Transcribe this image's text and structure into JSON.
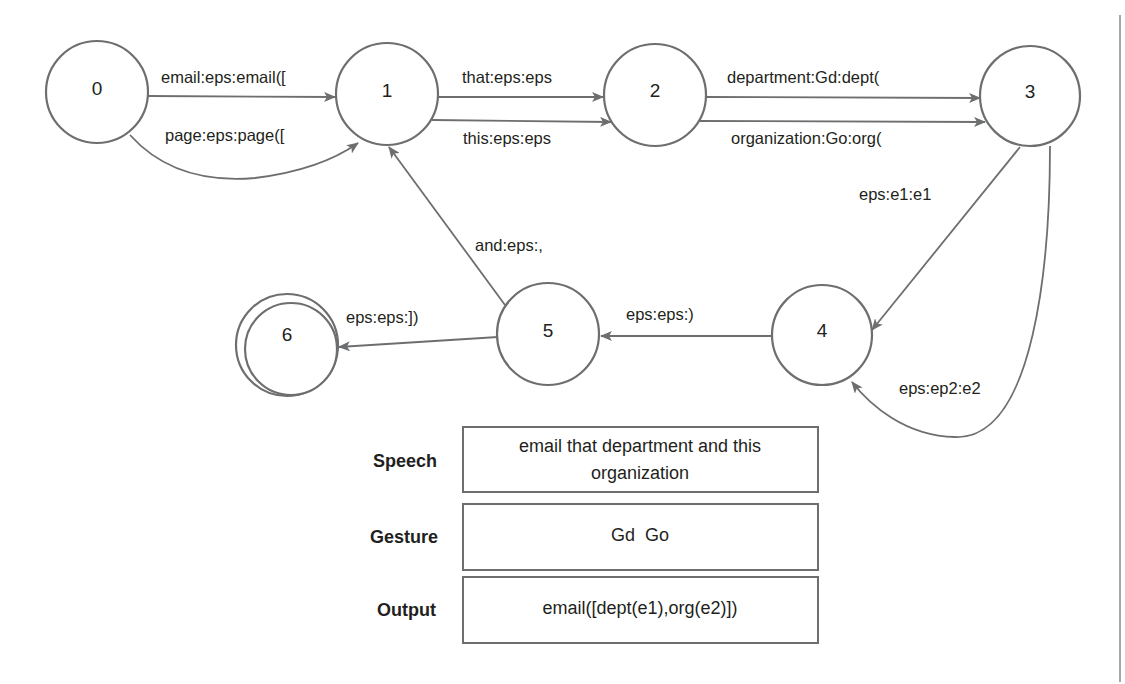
{
  "diagram": {
    "type": "finite-state transducer",
    "states": [
      {
        "id": "0",
        "label": "0",
        "final": false
      },
      {
        "id": "1",
        "label": "1",
        "final": false
      },
      {
        "id": "2",
        "label": "2",
        "final": false
      },
      {
        "id": "3",
        "label": "3",
        "final": false
      },
      {
        "id": "4",
        "label": "4",
        "final": false
      },
      {
        "id": "5",
        "label": "5",
        "final": false
      },
      {
        "id": "6",
        "label": "6",
        "final": true
      }
    ],
    "transitions": [
      {
        "from": "0",
        "to": "1",
        "label": "email:eps:email(["
      },
      {
        "from": "0",
        "to": "1",
        "label": "page:eps:page(["
      },
      {
        "from": "1",
        "to": "2",
        "label": "that:eps:eps"
      },
      {
        "from": "1",
        "to": "2",
        "label": "this:eps:eps"
      },
      {
        "from": "2",
        "to": "3",
        "label": "department:Gd:dept("
      },
      {
        "from": "2",
        "to": "3",
        "label": "organization:Go:org("
      },
      {
        "from": "3",
        "to": "4",
        "label": "eps:e1:e1"
      },
      {
        "from": "3",
        "to": "4",
        "label": "eps:ep2:e2"
      },
      {
        "from": "4",
        "to": "5",
        "label": "eps:eps:)"
      },
      {
        "from": "5",
        "to": "1",
        "label": "and:eps:,"
      },
      {
        "from": "5",
        "to": "6",
        "label": "eps:eps:])"
      }
    ]
  },
  "example": {
    "rows": [
      {
        "label": "Speech",
        "lines": [
          "email that department and this",
          "organization"
        ]
      },
      {
        "label": "Gesture",
        "lines": [
          "Gd  Go"
        ]
      },
      {
        "label": "Output",
        "lines": [
          "email([dept(e1),org(e2)])"
        ]
      }
    ]
  },
  "colors": {
    "stroke": "#6d6e70",
    "text": "#231f20",
    "background": "#ffffff"
  }
}
